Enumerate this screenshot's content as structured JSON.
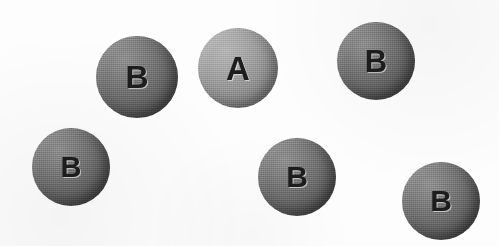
{
  "figure": {
    "background_color": "#fdfdfd",
    "width": 499,
    "height": 246
  },
  "legend": {
    "type_a_color": "#949494",
    "type_b_color": "#6a6a6a",
    "label_color": "#1d1d1d"
  },
  "chart_data": {
    "type": "scatter",
    "title": "",
    "xlabel": "",
    "ylabel": "",
    "xlim": [
      0,
      499
    ],
    "ylim": [
      0,
      246
    ],
    "grid": false,
    "legend_position": "none",
    "series": [
      {
        "name": "A",
        "fill": "#949494",
        "values": [
          {
            "label": "A",
            "cx": 238,
            "cy": 68,
            "r": 40
          }
        ]
      },
      {
        "name": "B",
        "fill": "#6a6a6a",
        "values": [
          {
            "label": "B",
            "cx": 137,
            "cy": 77,
            "r": 41
          },
          {
            "label": "B",
            "cx": 376,
            "cy": 61,
            "r": 39
          },
          {
            "label": "B",
            "cx": 71,
            "cy": 167,
            "r": 39
          },
          {
            "label": "B",
            "cx": 297,
            "cy": 177,
            "r": 39
          },
          {
            "label": "B",
            "cx": 441,
            "cy": 201,
            "r": 39
          }
        ]
      }
    ]
  },
  "spheres": [
    {
      "label": "A",
      "type": "a",
      "cx": 238,
      "cy": 68,
      "r": 40,
      "font_size": 33,
      "name": "sphere-a-top-center"
    },
    {
      "label": "B",
      "type": "b",
      "cx": 137,
      "cy": 77,
      "r": 41,
      "font_size": 32,
      "name": "sphere-b-top-left"
    },
    {
      "label": "B",
      "type": "b",
      "cx": 376,
      "cy": 61,
      "r": 39,
      "font_size": 31,
      "name": "sphere-b-top-right"
    },
    {
      "label": "B",
      "type": "b",
      "cx": 71,
      "cy": 167,
      "r": 39,
      "font_size": 29,
      "name": "sphere-b-bottom-left"
    },
    {
      "label": "B",
      "type": "b",
      "cx": 297,
      "cy": 177,
      "r": 39,
      "font_size": 30,
      "name": "sphere-b-bottom-center"
    },
    {
      "label": "B",
      "type": "b",
      "cx": 441,
      "cy": 201,
      "r": 39,
      "font_size": 30,
      "name": "sphere-b-bottom-right"
    }
  ]
}
